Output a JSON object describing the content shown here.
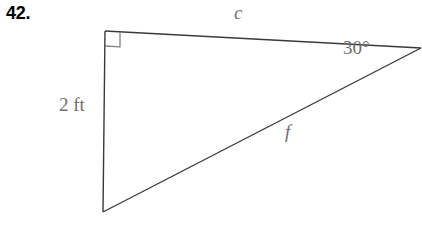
{
  "problem": {
    "number": "42."
  },
  "figure": {
    "type": "right-triangle-diagram",
    "stroke_color": "#3a3a3a",
    "label_color": "#6e6e6e",
    "vertices": {
      "top_left": [
        105,
        31
      ],
      "right": [
        420,
        48
      ],
      "bottom_left": [
        103,
        212
      ]
    },
    "right_angle_marker": {
      "at": "top_left",
      "size": 14
    },
    "labels": {
      "hypotenuse_top": "c",
      "hypotenuse_lower": "f",
      "angle": "30°",
      "vertical_side": "2 ft"
    }
  }
}
